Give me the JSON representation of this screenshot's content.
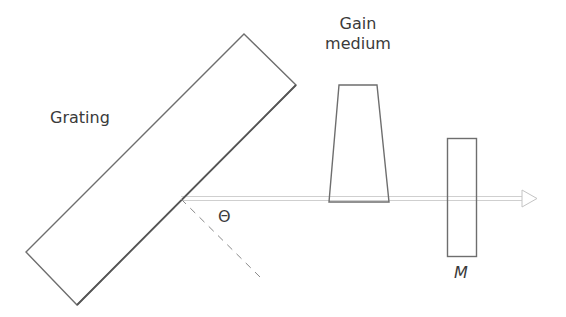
{
  "diagram": {
    "type": "laser-cavity-littrow-grating",
    "labels": {
      "grating": "Grating",
      "gain_line1": "Gain",
      "gain_line2": "medium",
      "angle": "Θ",
      "mirror": "M"
    },
    "colors": {
      "outline": "#6e6e6e",
      "beam": "#c8c8c8",
      "dashed_normal": "#8a8a8a",
      "text": "#3a3a3a"
    },
    "elements": [
      {
        "id": "grating",
        "shape": "rotated-rectangle",
        "points": [
          [
            244,
            34
          ],
          [
            296,
            85
          ],
          [
            77,
            305
          ],
          [
            26,
            252
          ]
        ]
      },
      {
        "id": "gain-medium",
        "shape": "trapezoid",
        "points": [
          [
            339,
            85
          ],
          [
            377,
            85
          ],
          [
            389,
            202
          ],
          [
            329,
            202
          ]
        ]
      },
      {
        "id": "output-mirror",
        "shape": "rectangle",
        "x": 447,
        "y": 138,
        "w": 29,
        "h": 118
      },
      {
        "id": "beam",
        "shape": "arrow",
        "from": [
          181,
          198
        ],
        "to": [
          537,
          198
        ]
      },
      {
        "id": "grating-normal",
        "shape": "dashed-line",
        "from": [
          181,
          199
        ],
        "to": [
          260,
          277
        ]
      }
    ]
  }
}
